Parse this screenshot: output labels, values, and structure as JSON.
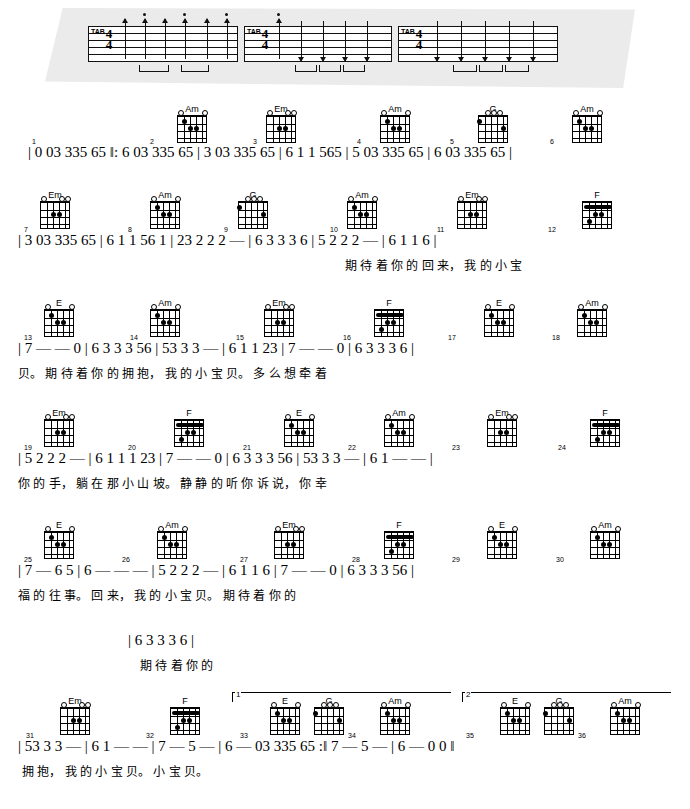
{
  "document": {
    "type": "guitar-chord-and-numbered-notation-sheet",
    "language": "zh",
    "tab_label": "TAB",
    "time_signature": "4/4"
  },
  "intro": {
    "measures": 3
  },
  "lines": [
    {
      "id": 1,
      "measure_numbers": [
        "1",
        "2",
        "3",
        "4",
        "5",
        "6"
      ],
      "chords": [
        "Am",
        "Em",
        "Am",
        "G",
        "Am"
      ],
      "notes": "| 0 03 335 65 ‖: 6 03 335 65 | 3 03 335 65 | 6 1 1 565 | 5 03 335 65 | 6 03 335 65 |",
      "lyrics": ""
    },
    {
      "id": 2,
      "measure_numbers": [
        "7",
        "8",
        "9",
        "10",
        "11",
        "12"
      ],
      "chords": [
        "Em",
        "Am",
        "G",
        "Am",
        "Em",
        "F"
      ],
      "notes": "| 3 03 335 65 | 6 1 1 56 1 | 23 2 2 2 — | 6 3 3 3 6 | 5 2 2 2 — | 6 1 1 6 |",
      "lyrics": "期 待 着 你 的    回   来，     我 的 小 宝"
    },
    {
      "id": 3,
      "measure_numbers": [
        "13",
        "14",
        "15",
        "16",
        "17",
        "18"
      ],
      "chords": [
        "E",
        "Am",
        "Em",
        "F",
        "E",
        "Am"
      ],
      "notes": "| 7 — — 0 | 6 3 3 3 56 | 53 3 3 — | 6 1 1 23 | 7 — — 0 | 6 3 3 3 6 |",
      "lyrics": "贝。       期 待 着 你 的  拥 抱，    我 的 小 宝 贝。          多 么 想 牵 着"
    },
    {
      "id": 4,
      "measure_numbers": [
        "19",
        "20",
        "21",
        "22",
        "23",
        "24"
      ],
      "chords": [
        "Em",
        "F",
        "E",
        "Am",
        "Em",
        "F"
      ],
      "notes": "| 5 2 2 2 — | 6 1 1 1 23 | 7 — — 0 | 6 3 3 3 56 | 53 3 3 — | 6 1 — — |",
      "lyrics": "你 的 手，    躺 在 那 小 山  坡。       静 静 的 听 你  诉 说，    你 幸"
    },
    {
      "id": 5,
      "measure_numbers": [
        "25",
        "26",
        "27",
        "28",
        "29",
        "30"
      ],
      "chords": [
        "E",
        "Am",
        "Em",
        "F",
        "E",
        "Am"
      ],
      "notes": "| 7 — 6 5 | 6 — — — | 5 2 2 2 — | 6 1 1 6 | 7 — — 0 | 6 3 3 3 56 |",
      "lyrics": "福 的 往 事。        回 来，    我 的 小 宝 贝。         期 待 着 你 的"
    },
    {
      "id": 6,
      "measure_numbers": [],
      "chords": [],
      "notes": "| 6 3 3 3 6 |",
      "lyrics": "期 待 着 你 的"
    },
    {
      "id": 7,
      "measure_numbers": [
        "31",
        "32",
        "33",
        "34",
        "35",
        "36"
      ],
      "chords": [
        "Em",
        "F",
        "E",
        "G",
        "Am",
        "E",
        "G",
        "Am"
      ],
      "notes": "| 53 3 3 — | 6 1 — — | 7 — 5 — | 6 — 03 335 65 :‖ 7 — 5 — | 6 — 0 0 ‖",
      "lyrics": "拥 抱，    我 的     小 宝 贝。      小 宝 贝。",
      "endings": [
        "1",
        "2"
      ]
    }
  ]
}
